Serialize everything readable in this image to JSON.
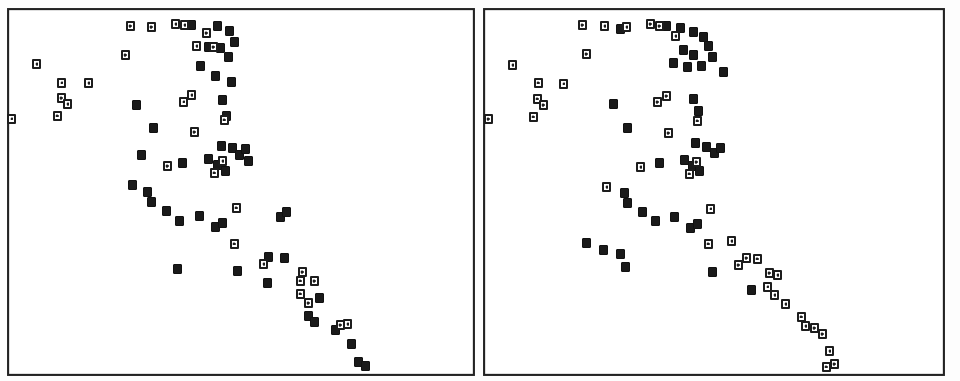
{
  "figure": {
    "name": "two-panel-scatter-figure",
    "width": 960,
    "height": 381,
    "background_color": "#ffffff",
    "ink_color": "#1a1a1a",
    "frame_color": "#222222",
    "marker_open_label": "open-square-with-cross",
    "marker_filled_label": "filled-square",
    "title": "",
    "caption": ""
  },
  "chart_data": [
    {
      "type": "scatter",
      "panel_id": "left-panel",
      "panel_label": "",
      "title": "",
      "xlabel": "",
      "ylabel": "",
      "xlim": [
        0,
        100
      ],
      "ylim": [
        0,
        100
      ],
      "grid": false,
      "legend_position": "none",
      "axis_style": "box-frame-no-ticks",
      "series": [
        {
          "name": "filled-square",
          "marker": "filled-square",
          "color": "#1a1a1a",
          "points": [
            [
              39.4,
              96.2
            ],
            [
              44.8,
              96.0
            ],
            [
              47.5,
              94.7
            ],
            [
              48.5,
              91.6
            ],
            [
              43.0,
              90.2
            ],
            [
              45.7,
              89.9
            ],
            [
              47.2,
              87.4
            ],
            [
              41.2,
              84.9
            ],
            [
              44.5,
              82.1
            ],
            [
              48.1,
              80.5
            ],
            [
              27.5,
              74.2
            ],
            [
              46.0,
              75.4
            ],
            [
              46.8,
              71.3
            ],
            [
              31.0,
              67.8
            ],
            [
              45.9,
              63.0
            ],
            [
              48.2,
              62.2
            ],
            [
              49.7,
              60.4
            ],
            [
              51.0,
              62.0
            ],
            [
              28.6,
              60.2
            ],
            [
              43.0,
              59.3
            ],
            [
              45.0,
              57.4
            ],
            [
              46.6,
              56.0
            ],
            [
              51.6,
              58.6
            ],
            [
              37.3,
              58.2
            ],
            [
              26.4,
              51.9
            ],
            [
              29.8,
              50.1
            ],
            [
              30.8,
              47.5
            ],
            [
              33.9,
              44.7
            ],
            [
              36.6,
              42.3
            ],
            [
              41.0,
              43.6
            ],
            [
              44.6,
              40.4
            ],
            [
              46.0,
              41.6
            ],
            [
              58.5,
              43.1
            ],
            [
              59.9,
              44.4
            ],
            [
              56.0,
              32.2
            ],
            [
              59.4,
              32.1
            ],
            [
              55.6,
              25.0
            ],
            [
              66.8,
              21.0
            ],
            [
              64.5,
              16.0
            ],
            [
              66.0,
              14.5
            ],
            [
              70.5,
              12.2
            ],
            [
              74.0,
              8.2
            ],
            [
              75.5,
              3.1
            ],
            [
              77.0,
              1.9
            ],
            [
              36.2,
              29.0
            ],
            [
              49.2,
              28.2
            ]
          ]
        },
        {
          "name": "open-square",
          "marker": "open-square-with-cross",
          "color": "#1d1d1d",
          "points": [
            [
              26.0,
              96.0
            ],
            [
              30.5,
              95.8
            ],
            [
              35.8,
              96.5
            ],
            [
              37.9,
              96.2
            ],
            [
              42.4,
              94.0
            ],
            [
              40.3,
              90.5
            ],
            [
              44.0,
              90.1
            ],
            [
              25.0,
              88.0
            ],
            [
              5.8,
              85.4
            ],
            [
              11.3,
              80.5
            ],
            [
              17.0,
              80.3
            ],
            [
              11.1,
              76.0
            ],
            [
              12.5,
              74.3
            ],
            [
              39.4,
              76.8
            ],
            [
              37.5,
              75.0
            ],
            [
              46.3,
              70.0
            ],
            [
              39.8,
              66.6
            ],
            [
              46.0,
              58.6
            ],
            [
              44.3,
              55.5
            ],
            [
              33.9,
              57.1
            ],
            [
              49.0,
              45.9
            ],
            [
              48.5,
              36.0
            ],
            [
              55.0,
              30.3
            ],
            [
              63.3,
              28.1
            ],
            [
              62.9,
              25.7
            ],
            [
              65.8,
              25.4
            ],
            [
              62.8,
              22.1
            ],
            [
              64.5,
              19.5
            ],
            [
              71.5,
              13.3
            ],
            [
              73.2,
              13.6
            ],
            [
              10.3,
              71.2
            ],
            [
              0.4,
              70.5
            ]
          ]
        }
      ]
    },
    {
      "type": "scatter",
      "panel_id": "right-panel",
      "panel_label": "",
      "title": "",
      "xlabel": "",
      "ylabel": "",
      "xlim": [
        0,
        100
      ],
      "ylim": [
        0,
        100
      ],
      "grid": false,
      "legend_position": "none",
      "axis_style": "box-frame-no-ticks",
      "series": [
        {
          "name": "filled-square",
          "marker": "filled-square",
          "color": "#1a1a1a",
          "points": [
            [
              29.5,
              95.2
            ],
            [
              39.4,
              96.0
            ],
            [
              42.5,
              95.4
            ],
            [
              45.5,
              94.3
            ],
            [
              47.6,
              93.0
            ],
            [
              48.8,
              90.3
            ],
            [
              43.3,
              89.4
            ],
            [
              45.4,
              88.0
            ],
            [
              41.0,
              85.6
            ],
            [
              44.2,
              84.8
            ],
            [
              47.1,
              85.0
            ],
            [
              49.6,
              87.2
            ],
            [
              52.0,
              83.3
            ],
            [
              27.8,
              74.4
            ],
            [
              45.5,
              75.8
            ],
            [
              46.7,
              72.4
            ],
            [
              31.2,
              67.9
            ],
            [
              46.0,
              63.5
            ],
            [
              48.4,
              62.4
            ],
            [
              50.0,
              60.8
            ],
            [
              51.3,
              62.4
            ],
            [
              43.5,
              59.0
            ],
            [
              45.2,
              57.2
            ],
            [
              46.8,
              55.8
            ],
            [
              38.0,
              58.0
            ],
            [
              30.2,
              49.8
            ],
            [
              31.2,
              47.2
            ],
            [
              34.4,
              44.5
            ],
            [
              37.0,
              42.0
            ],
            [
              41.4,
              43.4
            ],
            [
              45.0,
              40.2
            ],
            [
              46.4,
              41.4
            ],
            [
              25.8,
              34.0
            ],
            [
              29.4,
              33.0
            ],
            [
              30.6,
              29.4
            ],
            [
              22.0,
              36.0
            ],
            [
              49.5,
              28.0
            ],
            [
              58.3,
              23.0
            ]
          ]
        },
        {
          "name": "open-square",
          "marker": "open-square-with-cross",
          "color": "#1d1d1d",
          "points": [
            [
              21.0,
              96.2
            ],
            [
              26.0,
              96.0
            ],
            [
              30.8,
              95.6
            ],
            [
              36.0,
              96.4
            ],
            [
              38.1,
              96.0
            ],
            [
              41.6,
              93.0
            ],
            [
              5.9,
              85.2
            ],
            [
              11.4,
              80.3
            ],
            [
              17.1,
              80.0
            ],
            [
              11.2,
              75.8
            ],
            [
              12.6,
              74.0
            ],
            [
              22.1,
              88.2
            ],
            [
              39.6,
              76.6
            ],
            [
              37.6,
              74.8
            ],
            [
              46.4,
              69.8
            ],
            [
              39.9,
              66.4
            ],
            [
              46.1,
              58.4
            ],
            [
              44.5,
              55.3
            ],
            [
              34.0,
              56.9
            ],
            [
              49.2,
              45.7
            ],
            [
              26.6,
              51.6
            ],
            [
              48.8,
              35.8
            ],
            [
              55.4,
              30.0
            ],
            [
              54.0,
              36.4
            ],
            [
              57.0,
              32.0
            ],
            [
              59.6,
              31.6
            ],
            [
              62.2,
              27.8
            ],
            [
              64.0,
              27.0
            ],
            [
              61.8,
              24.0
            ],
            [
              63.4,
              21.8
            ],
            [
              65.6,
              19.2
            ],
            [
              69.0,
              15.8
            ],
            [
              70.0,
              13.0
            ],
            [
              72.0,
              12.4
            ],
            [
              73.6,
              11.0
            ],
            [
              75.4,
              6.2
            ],
            [
              76.5,
              2.6
            ],
            [
              74.6,
              1.8
            ],
            [
              10.4,
              71.0
            ],
            [
              0.5,
              70.3
            ]
          ]
        }
      ]
    }
  ],
  "panels": [
    {
      "id": "left-panel",
      "name": "left-scatter-panel",
      "left": 7,
      "top": 8,
      "width": 468,
      "height": 368
    },
    {
      "id": "right-panel",
      "name": "right-scatter-panel",
      "left": 483,
      "top": 8,
      "width": 462,
      "height": 368
    }
  ]
}
